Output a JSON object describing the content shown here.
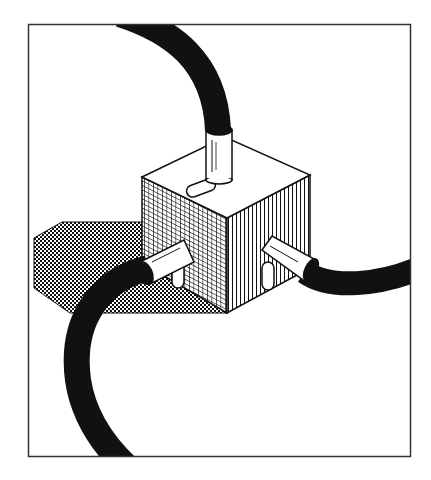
{
  "illustration": {
    "subject": "isometric cube junction box with three connected cables",
    "colors": {
      "background": "#ffffff",
      "ink": "#111111",
      "frame": "#333333"
    },
    "frame": {
      "x": 28,
      "y": 24,
      "width": 383,
      "height": 433
    },
    "elements": [
      "frame-border",
      "cube-shadow",
      "cube-top-face",
      "cube-left-face-grid",
      "cube-right-face-lines",
      "top-connector",
      "left-connector",
      "right-connector",
      "top-cable",
      "left-cable",
      "right-cable",
      "top-slot",
      "left-slot",
      "right-slot"
    ]
  }
}
